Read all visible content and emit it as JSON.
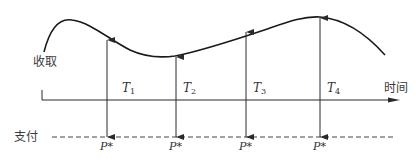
{
  "diagram": {
    "labels": {
      "receive": "收取",
      "pay": "支付",
      "time": "时间"
    },
    "periods": [
      {
        "label": "T",
        "sub": "1",
        "payment_label": "P*"
      },
      {
        "label": "T",
        "sub": "2",
        "payment_label": "P*"
      },
      {
        "label": "T",
        "sub": "3",
        "payment_label": "P*"
      },
      {
        "label": "T",
        "sub": "4",
        "payment_label": "P*"
      }
    ],
    "colors": {
      "curve": "#1a1a1a",
      "axis": "#2a2a2a",
      "arrows": "#2a2a2a",
      "dashed": "#444444",
      "text": "#333333"
    }
  }
}
